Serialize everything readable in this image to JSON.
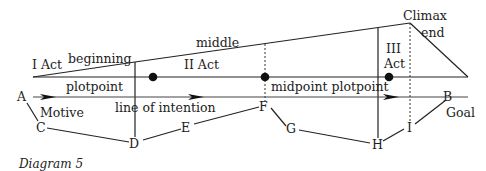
{
  "diagram": {
    "caption": "Diagram 5",
    "structure_labels": {
      "act1": "I Act",
      "act2": "II Act",
      "act3_line1": "III",
      "act3_line2": "Act",
      "beginning": "beginning",
      "middle": "middle",
      "climax": "Climax",
      "end": "end",
      "plotpoint": "plotpoint",
      "midpoint_plotpoint": "midpoint plotpoint",
      "line_of_intention": "line of intention",
      "motive": "Motive",
      "goal": "Goal"
    },
    "points": {
      "A": "A",
      "B": "B",
      "C": "C",
      "D": "D",
      "E": "E",
      "F": "F",
      "G": "G",
      "H": "H",
      "I": "I"
    },
    "path_order": [
      "A",
      "C",
      "D",
      "E",
      "F",
      "G",
      "H",
      "I",
      "B"
    ],
    "plot_points_count": 3
  }
}
